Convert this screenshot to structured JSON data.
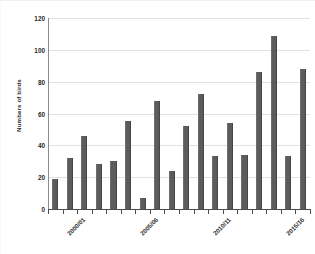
{
  "chart_data": {
    "type": "bar",
    "title": "",
    "xlabel": "",
    "ylabel": "Numbers of birds",
    "ylim": [
      0,
      120
    ],
    "yticks": [
      0,
      20,
      40,
      60,
      80,
      100,
      120
    ],
    "ytick_labels": [
      "0",
      "20",
      "40",
      "60",
      "80",
      "100",
      "120"
    ],
    "grid": true,
    "legend": "none",
    "bar_color": "#5c5c5c",
    "categories": [
      "2000/01",
      "2001/02",
      "2002/03",
      "2003/04",
      "2004/05",
      "2005/06",
      "2006/07",
      "2007/08",
      "2008/09",
      "2009/10",
      "2010/11",
      "2011/12",
      "2012/13",
      "2013/14",
      "2014/15",
      "2015/16",
      "2016/17",
      "2017/18"
    ],
    "values": [
      19,
      32,
      46,
      28,
      30,
      55,
      7,
      68,
      24,
      52,
      72,
      33,
      54,
      34,
      86,
      109,
      33,
      88
    ],
    "visible_xtick_labels": [
      {
        "index": 0,
        "label": "2000/01"
      },
      {
        "index": 5,
        "label": "2005/06"
      },
      {
        "index": 10,
        "label": "2010/11"
      },
      {
        "index": 15,
        "label": "2015/16"
      }
    ]
  }
}
